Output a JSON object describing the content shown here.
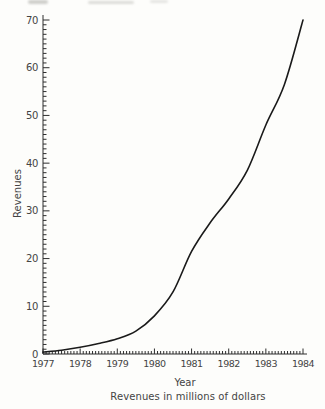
{
  "figure": {
    "caption": "Revenues in millions of dollars",
    "x_axis": {
      "label": "Year",
      "tick_labels": [
        "1977",
        "1978",
        "1979",
        "1980",
        "1981",
        "1982",
        "1983",
        "1984"
      ],
      "min": 1977,
      "max": 1984,
      "major_step": 1,
      "minor_divisions_per_major": 12
    },
    "y_axis": {
      "label": "Revenues",
      "tick_labels": [
        "0",
        "10",
        "20",
        "30",
        "40",
        "50",
        "60",
        "70"
      ],
      "min": 0,
      "max": 70,
      "major_step": 10,
      "minor_step": 1
    }
  },
  "chart_data": {
    "type": "line",
    "title": "",
    "xlabel": "Year",
    "ylabel": "Revenues",
    "caption": "Revenues in millions of dollars",
    "x": [
      1977,
      1977.5,
      1978,
      1978.5,
      1979,
      1979.5,
      1980,
      1980.5,
      1981,
      1981.5,
      1982,
      1982.5,
      1983,
      1983.5,
      1984
    ],
    "y": [
      0.4,
      0.8,
      1.4,
      2.2,
      3.2,
      4.8,
      8,
      13,
      21.5,
      27.5,
      32.5,
      38.5,
      48,
      56.5,
      70
    ],
    "xlim": [
      1977,
      1984
    ],
    "ylim": [
      0,
      70
    ],
    "grid": false,
    "legend": null,
    "line_color": "#1a1a1a",
    "axis_color": "#2e2e2e"
  }
}
